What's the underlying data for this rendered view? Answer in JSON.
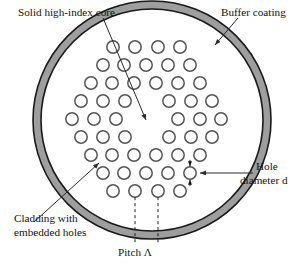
{
  "figure": {
    "name": "photonic-crystal-fiber-cross-section",
    "background": "#ffffff"
  },
  "labels": {
    "core": "Solid high-index core",
    "buffer": "Buffer coating",
    "cladding_line1": "Cladding with",
    "cladding_line2": "embedded holes",
    "hole_line1": "Hole",
    "hole_line2": "diameter d",
    "pitch": "Pitch Λ"
  },
  "colors": {
    "ring_fill": "#9e9e9e",
    "ring_stroke": "#1a1a1a",
    "hole_stroke": "#555555",
    "hole_fill": "#ffffff",
    "leader_stroke": "#2a2a2a",
    "text": "#111111",
    "dash_stroke": "#1a1a1a"
  },
  "geometry": {
    "outer_circle": {
      "cx": 152,
      "cy": 120,
      "r": 119
    },
    "inner_circle": {
      "cx": 152,
      "cy": 120,
      "r": 111
    },
    "hole_radius": 6.2,
    "pitch_px": 18.5,
    "row_step_px": 17.5
  },
  "holes": {
    "rows": [
      {
        "row": 1,
        "y": 47,
        "xs": [
          113,
          135,
          158,
          180
        ]
      },
      {
        "row": 2,
        "y": 65,
        "xs": [
          103,
          124,
          146,
          168,
          190
        ]
      },
      {
        "row": 3,
        "y": 83,
        "xs": [
          91,
          112,
          134,
          156,
          178,
          200
        ]
      },
      {
        "row": 4,
        "y": 101,
        "xs": [
          81,
          103,
          125,
          169,
          191,
          212
        ]
      },
      {
        "row": 5,
        "y": 119,
        "xs": [
          72,
          94,
          116,
          178,
          200,
          221
        ]
      },
      {
        "row": 6,
        "y": 137,
        "xs": [
          81,
          103,
          125,
          169,
          191,
          212
        ]
      },
      {
        "row": 7,
        "y": 155,
        "xs": [
          91,
          112,
          134,
          156,
          178,
          200
        ]
      },
      {
        "row": 8,
        "y": 173,
        "xs": [
          103,
          124,
          146,
          168,
          190
        ]
      },
      {
        "row": 9,
        "y": 191,
        "xs": [
          113,
          135,
          158,
          180
        ]
      }
    ],
    "marked_hole": {
      "cx": 190,
      "cy": 173,
      "label": "hole-diameter-marker"
    },
    "pitch_holes": [
      135,
      158
    ],
    "pitch_row_y": 191
  },
  "leaders": {
    "core": {
      "x1": 103,
      "y1": 18,
      "x2": 146,
      "y2": 120
    },
    "buffer": {
      "x1": 238,
      "y1": 18,
      "x2": 215,
      "y2": 45
    },
    "cladding": {
      "x1": 34,
      "y1": 222,
      "x2": 99,
      "y2": 163
    },
    "hole": {
      "x1": 253,
      "y1": 173,
      "x2": 200,
      "y2": 173
    }
  },
  "label_positions": {
    "core": {
      "x": 18,
      "y": 16
    },
    "buffer": {
      "x": 221,
      "y": 16
    },
    "cladding1": {
      "x": 14,
      "y": 222
    },
    "cladding2": {
      "x": 14,
      "y": 236
    },
    "hole1": {
      "x": 256,
      "y": 170
    },
    "hole2": {
      "x": 240,
      "y": 184
    },
    "pitch": {
      "x": 118,
      "y": 256
    }
  }
}
